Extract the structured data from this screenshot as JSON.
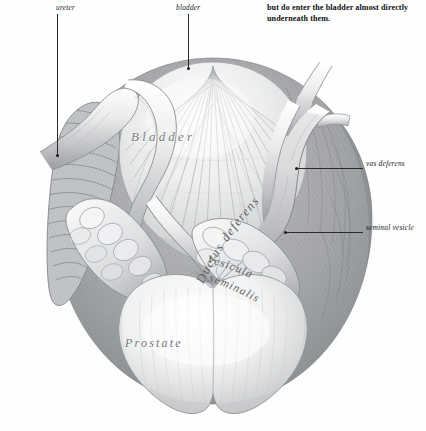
{
  "page": {
    "width": 426,
    "height": 431,
    "background": "#fefefe",
    "kind": "anatomical-engraving-plate"
  },
  "caption": {
    "text": "but do enter the bladder almost directly underneath them."
  },
  "callouts": [
    {
      "id": "ureter",
      "label": "ureter",
      "side": "top-left"
    },
    {
      "id": "bladder",
      "label": "bladder",
      "side": "top-center"
    },
    {
      "id": "vas-deferens",
      "label": "vas deferens",
      "side": "right"
    },
    {
      "id": "seminal-vesicle",
      "label": "seminal vesicle",
      "side": "right"
    }
  ],
  "plate_labels": {
    "bladder": "Bladder",
    "prostate": "Prostate",
    "ductus_deferens": "Ductus deferens",
    "vesicula": "Vesicula",
    "seminalis": "seminalis"
  },
  "colors": {
    "ink": "#2b2b2b",
    "engraving_mid": "#9a9ca0",
    "engraving_dark": "#5d6064",
    "engraving_light": "#e8e9ea",
    "label_grey": "#6d6f72",
    "paper": "#fefefe"
  }
}
